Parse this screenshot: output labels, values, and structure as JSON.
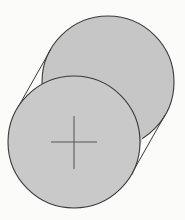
{
  "figure": {
    "type": "cylinder",
    "colors": {
      "fill": "#c6c6c6",
      "front_face_fill": "#c9c9c9",
      "outline": "#3a3a3a",
      "cross": "#555555",
      "background": "#fbfbfa"
    },
    "front_circle": {
      "cx": 74,
      "cy": 142,
      "r": 66
    },
    "back_circle": {
      "cx": 108,
      "cy": 82,
      "r": 66
    },
    "cross": {
      "cx": 74,
      "cy": 142,
      "half_width": 23,
      "half_height": 26
    }
  },
  "background_text": "—\n—\n—\n—\n—\n—\n—\n—\n—\n—\n—"
}
